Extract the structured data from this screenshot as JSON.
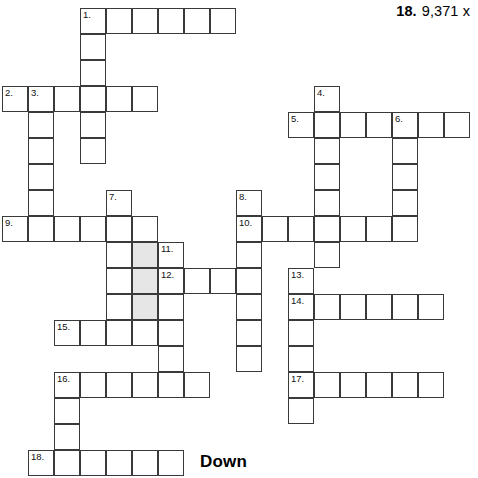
{
  "header": {
    "number": "18.",
    "value": "9,371 x"
  },
  "section": {
    "down_label": "Down"
  },
  "grid": {
    "cell_size": 26,
    "origin_x": 2,
    "origin_y": 8,
    "border_color": "#3a3a3a",
    "cell_fill": "#ffffff",
    "shaded_fill": "#e6e6e6",
    "columns": 18,
    "rows": 18,
    "cells": [
      {
        "c": 3,
        "r": 0,
        "n": "1."
      },
      {
        "c": 4,
        "r": 0
      },
      {
        "c": 5,
        "r": 0
      },
      {
        "c": 6,
        "r": 0
      },
      {
        "c": 7,
        "r": 0
      },
      {
        "c": 8,
        "r": 0
      },
      {
        "c": 3,
        "r": 1
      },
      {
        "c": 3,
        "r": 2
      },
      {
        "c": 0,
        "r": 3,
        "n": "2."
      },
      {
        "c": 1,
        "r": 3,
        "n": "3."
      },
      {
        "c": 2,
        "r": 3
      },
      {
        "c": 3,
        "r": 3
      },
      {
        "c": 4,
        "r": 3
      },
      {
        "c": 5,
        "r": 3
      },
      {
        "c": 12,
        "r": 3,
        "n": "4."
      },
      {
        "c": 1,
        "r": 4
      },
      {
        "c": 3,
        "r": 4
      },
      {
        "c": 11,
        "r": 4,
        "n": "5."
      },
      {
        "c": 12,
        "r": 4
      },
      {
        "c": 13,
        "r": 4
      },
      {
        "c": 14,
        "r": 4
      },
      {
        "c": 15,
        "r": 4,
        "n": "6."
      },
      {
        "c": 16,
        "r": 4
      },
      {
        "c": 17,
        "r": 4
      },
      {
        "c": 1,
        "r": 5
      },
      {
        "c": 3,
        "r": 5
      },
      {
        "c": 12,
        "r": 5
      },
      {
        "c": 15,
        "r": 5
      },
      {
        "c": 1,
        "r": 6
      },
      {
        "c": 12,
        "r": 6
      },
      {
        "c": 15,
        "r": 6
      },
      {
        "c": 1,
        "r": 7
      },
      {
        "c": 4,
        "r": 7,
        "n": "7."
      },
      {
        "c": 9,
        "r": 7,
        "n": "8."
      },
      {
        "c": 12,
        "r": 7
      },
      {
        "c": 15,
        "r": 7
      },
      {
        "c": 0,
        "r": 8,
        "n": "9."
      },
      {
        "c": 1,
        "r": 8
      },
      {
        "c": 2,
        "r": 8
      },
      {
        "c": 3,
        "r": 8
      },
      {
        "c": 4,
        "r": 8
      },
      {
        "c": 5,
        "r": 8
      },
      {
        "c": 9,
        "r": 8,
        "n": "10."
      },
      {
        "c": 10,
        "r": 8
      },
      {
        "c": 11,
        "r": 8
      },
      {
        "c": 12,
        "r": 8
      },
      {
        "c": 13,
        "r": 8
      },
      {
        "c": 14,
        "r": 8
      },
      {
        "c": 15,
        "r": 8
      },
      {
        "c": 4,
        "r": 9
      },
      {
        "c": 5,
        "r": 9,
        "shaded": true
      },
      {
        "c": 6,
        "r": 9,
        "n": "11."
      },
      {
        "c": 9,
        "r": 9
      },
      {
        "c": 12,
        "r": 9
      },
      {
        "c": 4,
        "r": 10
      },
      {
        "c": 5,
        "r": 10,
        "shaded": true
      },
      {
        "c": 6,
        "r": 10,
        "n": "12."
      },
      {
        "c": 7,
        "r": 10
      },
      {
        "c": 8,
        "r": 10
      },
      {
        "c": 9,
        "r": 10
      },
      {
        "c": 11,
        "r": 10,
        "n": "13."
      },
      {
        "c": 4,
        "r": 11
      },
      {
        "c": 5,
        "r": 11,
        "shaded": true
      },
      {
        "c": 6,
        "r": 11
      },
      {
        "c": 9,
        "r": 11
      },
      {
        "c": 11,
        "r": 11,
        "n": "14."
      },
      {
        "c": 12,
        "r": 11
      },
      {
        "c": 13,
        "r": 11
      },
      {
        "c": 14,
        "r": 11
      },
      {
        "c": 15,
        "r": 11
      },
      {
        "c": 16,
        "r": 11
      },
      {
        "c": 2,
        "r": 12,
        "n": "15."
      },
      {
        "c": 3,
        "r": 12
      },
      {
        "c": 4,
        "r": 12
      },
      {
        "c": 5,
        "r": 12
      },
      {
        "c": 6,
        "r": 12
      },
      {
        "c": 9,
        "r": 12
      },
      {
        "c": 11,
        "r": 12
      },
      {
        "c": 6,
        "r": 13
      },
      {
        "c": 9,
        "r": 13
      },
      {
        "c": 11,
        "r": 13
      },
      {
        "c": 2,
        "r": 14,
        "n": "16."
      },
      {
        "c": 3,
        "r": 14
      },
      {
        "c": 4,
        "r": 14
      },
      {
        "c": 5,
        "r": 14
      },
      {
        "c": 6,
        "r": 14
      },
      {
        "c": 7,
        "r": 14
      },
      {
        "c": 11,
        "r": 14,
        "n": "17."
      },
      {
        "c": 12,
        "r": 14
      },
      {
        "c": 13,
        "r": 14
      },
      {
        "c": 14,
        "r": 14
      },
      {
        "c": 15,
        "r": 14
      },
      {
        "c": 16,
        "r": 14
      },
      {
        "c": 2,
        "r": 15
      },
      {
        "c": 11,
        "r": 15
      },
      {
        "c": 2,
        "r": 16
      },
      {
        "c": 1,
        "r": 17,
        "n": "18."
      },
      {
        "c": 2,
        "r": 17
      },
      {
        "c": 3,
        "r": 17
      },
      {
        "c": 4,
        "r": 17
      },
      {
        "c": 5,
        "r": 17
      },
      {
        "c": 6,
        "r": 17
      }
    ]
  }
}
